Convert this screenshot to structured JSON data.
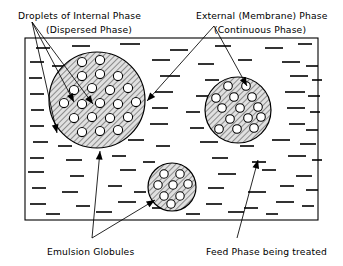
{
  "figure": {
    "width": 343,
    "height": 266,
    "background_color": "#ffffff",
    "line_color": "#000000",
    "globule_fill_color": "#d9d9d9",
    "droplet_fill_color": "#ffffff"
  },
  "labels": {
    "internal_phase": {
      "line1": "Droplets of Internal Phase",
      "line2": "(Dispersed Phase)",
      "line1_x": 18,
      "line1_y": 12,
      "line2_x": 46,
      "line2_y": 26,
      "anchor": "start"
    },
    "external_phase": {
      "line1": "External (Membrane) Phase",
      "line2": "(Continuous Phase)",
      "line1_x": 196,
      "line1_y": 12,
      "line2_x": 214,
      "line2_y": 26,
      "anchor": "start"
    },
    "emulsion_globules": {
      "text": "Emulsion Globules",
      "x": 47,
      "y": 248,
      "anchor": "start"
    },
    "feed_phase": {
      "text": "Feed Phase being treated",
      "x": 206,
      "y": 248,
      "anchor": "start"
    }
  },
  "container_box": {
    "name": "feed-phase-vessel",
    "x": 25,
    "y": 38,
    "width": 293,
    "height": 182
  },
  "globules": [
    {
      "name": "globule-large",
      "cx": 97,
      "cy": 100,
      "r": 48,
      "droplet_r": 4.6,
      "droplet_count": 32
    },
    {
      "name": "globule-medium",
      "cx": 238,
      "cy": 110,
      "r": 33,
      "droplet_r": 4.3,
      "droplet_count": 17
    },
    {
      "name": "globule-small",
      "cx": 172,
      "cy": 187,
      "r": 24,
      "droplet_r": 4.2,
      "droplet_count": 8
    }
  ],
  "internal_droplets": {
    "globule_large": [
      [
        82,
        62
      ],
      [
        100,
        60
      ],
      [
        118,
        62
      ],
      [
        64,
        74
      ],
      [
        82,
        76
      ],
      [
        100,
        74
      ],
      [
        118,
        76
      ],
      [
        131,
        74
      ],
      [
        56,
        88
      ],
      [
        74,
        90
      ],
      [
        92,
        88
      ],
      [
        110,
        90
      ],
      [
        128,
        88
      ],
      [
        64,
        103
      ],
      [
        82,
        104
      ],
      [
        100,
        103
      ],
      [
        118,
        104
      ],
      [
        136,
        102
      ],
      [
        56,
        117
      ],
      [
        74,
        118
      ],
      [
        92,
        117
      ],
      [
        110,
        118
      ],
      [
        128,
        117
      ],
      [
        64,
        131
      ],
      [
        82,
        132
      ],
      [
        100,
        131
      ],
      [
        118,
        130
      ],
      [
        75,
        143
      ],
      [
        93,
        142
      ],
      [
        111,
        141
      ],
      [
        136,
        116
      ],
      [
        61,
        60
      ]
    ],
    "globule_medium": [
      [
        228,
        86
      ],
      [
        246,
        86
      ],
      [
        216,
        98
      ],
      [
        234,
        97
      ],
      [
        252,
        97
      ],
      [
        222,
        108
      ],
      [
        240,
        108
      ],
      [
        258,
        107
      ],
      [
        212,
        119
      ],
      [
        230,
        119
      ],
      [
        248,
        118
      ],
      [
        219,
        129
      ],
      [
        237,
        129
      ],
      [
        254,
        128
      ],
      [
        228,
        138
      ],
      [
        246,
        137
      ],
      [
        261,
        117
      ]
    ],
    "globule_small": [
      [
        164,
        174
      ],
      [
        180,
        174
      ],
      [
        158,
        185
      ],
      [
        173,
        185
      ],
      [
        188,
        184
      ],
      [
        164,
        196
      ],
      [
        180,
        196
      ],
      [
        171,
        204
      ]
    ]
  },
  "feed_phase_dashes": [
    [
      36,
      48,
      14
    ],
    [
      72,
      46,
      18
    ],
    [
      120,
      44,
      20
    ],
    [
      170,
      50,
      18
    ],
    [
      215,
      46,
      16
    ],
    [
      265,
      48,
      18
    ],
    [
      298,
      44,
      14
    ],
    [
      30,
      62,
      14
    ],
    [
      52,
      66,
      12
    ],
    [
      152,
      60,
      18
    ],
    [
      198,
      64,
      16
    ],
    [
      238,
      60,
      14
    ],
    [
      282,
      62,
      18
    ],
    [
      306,
      66,
      12
    ],
    [
      29,
      78,
      13
    ],
    [
      160,
      76,
      20
    ],
    [
      205,
      80,
      14
    ],
    [
      290,
      76,
      18
    ],
    [
      312,
      80,
      10
    ],
    [
      30,
      94,
      14
    ],
    [
      155,
      92,
      18
    ],
    [
      196,
      96,
      16
    ],
    [
      285,
      92,
      20
    ],
    [
      308,
      96,
      12
    ],
    [
      31,
      110,
      13
    ],
    [
      152,
      108,
      16
    ],
    [
      186,
      112,
      14
    ],
    [
      287,
      108,
      18
    ],
    [
      310,
      112,
      10
    ],
    [
      30,
      126,
      14
    ],
    [
      150,
      124,
      18
    ],
    [
      190,
      128,
      14
    ],
    [
      289,
      124,
      16
    ],
    [
      306,
      130,
      12
    ],
    [
      33,
      142,
      15
    ],
    [
      58,
      146,
      14
    ],
    [
      128,
      140,
      16
    ],
    [
      156,
      146,
      14
    ],
    [
      200,
      142,
      18
    ],
    [
      240,
      146,
      14
    ],
    [
      272,
      140,
      18
    ],
    [
      300,
      144,
      16
    ],
    [
      30,
      158,
      14
    ],
    [
      66,
      160,
      16
    ],
    [
      112,
      156,
      14
    ],
    [
      143,
      162,
      12
    ],
    [
      212,
      158,
      16
    ],
    [
      252,
      162,
      14
    ],
    [
      288,
      156,
      18
    ],
    [
      312,
      160,
      10
    ],
    [
      28,
      172,
      16
    ],
    [
      70,
      176,
      14
    ],
    [
      120,
      170,
      16
    ],
    [
      218,
      174,
      18
    ],
    [
      262,
      170,
      14
    ],
    [
      296,
      176,
      16
    ],
    [
      32,
      188,
      14
    ],
    [
      62,
      192,
      16
    ],
    [
      108,
      186,
      14
    ],
    [
      134,
      192,
      12
    ],
    [
      208,
      188,
      16
    ],
    [
      248,
      192,
      18
    ],
    [
      280,
      186,
      14
    ],
    [
      306,
      190,
      12
    ],
    [
      30,
      204,
      16
    ],
    [
      76,
      206,
      14
    ],
    [
      118,
      202,
      18
    ],
    [
      152,
      208,
      14
    ],
    [
      206,
      204,
      16
    ],
    [
      244,
      208,
      14
    ],
    [
      276,
      202,
      18
    ],
    [
      302,
      206,
      12
    ],
    [
      46,
      214,
      14
    ],
    [
      96,
      212,
      16
    ],
    [
      186,
      214,
      14
    ],
    [
      228,
      212,
      16
    ],
    [
      266,
      214,
      12
    ]
  ],
  "leaders": {
    "internal_phase_fan": {
      "origin_x": 32,
      "origin_y": 22,
      "targets": [
        {
          "x": 93,
          "y": 104
        },
        {
          "x": 74,
          "y": 102
        },
        {
          "x": 57,
          "y": 133
        }
      ]
    },
    "external_phase_fan": {
      "vertex_x": 214,
      "vertex_y": 26,
      "targets": [
        {
          "x": 147,
          "y": 101
        },
        {
          "x": 247,
          "y": 86
        }
      ]
    },
    "emulsion_globules_fan": {
      "origin_x": 92,
      "origin_y": 238,
      "targets": [
        {
          "x": 100,
          "y": 151
        },
        {
          "x": 155,
          "y": 200
        }
      ]
    },
    "feed_phase_leader": {
      "origin_x": 237,
      "origin_y": 238,
      "target": {
        "x": 258,
        "y": 160
      }
    }
  }
}
